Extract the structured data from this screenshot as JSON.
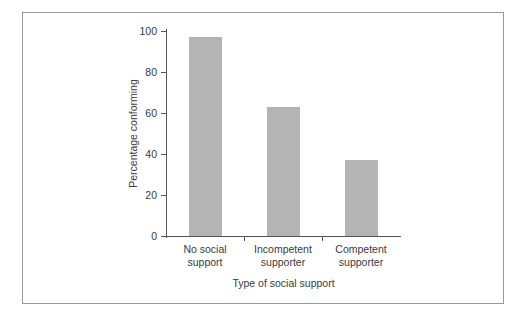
{
  "figure": {
    "frame_color": "#9a9a9a",
    "background": "#ffffff",
    "bar_color": "#b4b4b4",
    "axis_color": "#555555",
    "text_color": "#3b3b3b"
  },
  "chart_data": {
    "type": "bar",
    "title": "",
    "xlabel": "Type of social support",
    "ylabel": "Percentage conforming",
    "categories": [
      "No social support",
      "Incompetent supporter",
      "Competent supporter"
    ],
    "category_lines": [
      [
        "No social",
        "support"
      ],
      [
        "Incompetent",
        "supporter"
      ],
      [
        "Competent",
        "supporter"
      ]
    ],
    "values": [
      97,
      63,
      37
    ],
    "ylim": [
      0,
      100
    ],
    "yticks": [
      0,
      20,
      40,
      60,
      80,
      100
    ],
    "ytick_labels": [
      "0",
      "20",
      "40",
      "60",
      "80",
      "100"
    ],
    "grid": false,
    "legend": false
  }
}
